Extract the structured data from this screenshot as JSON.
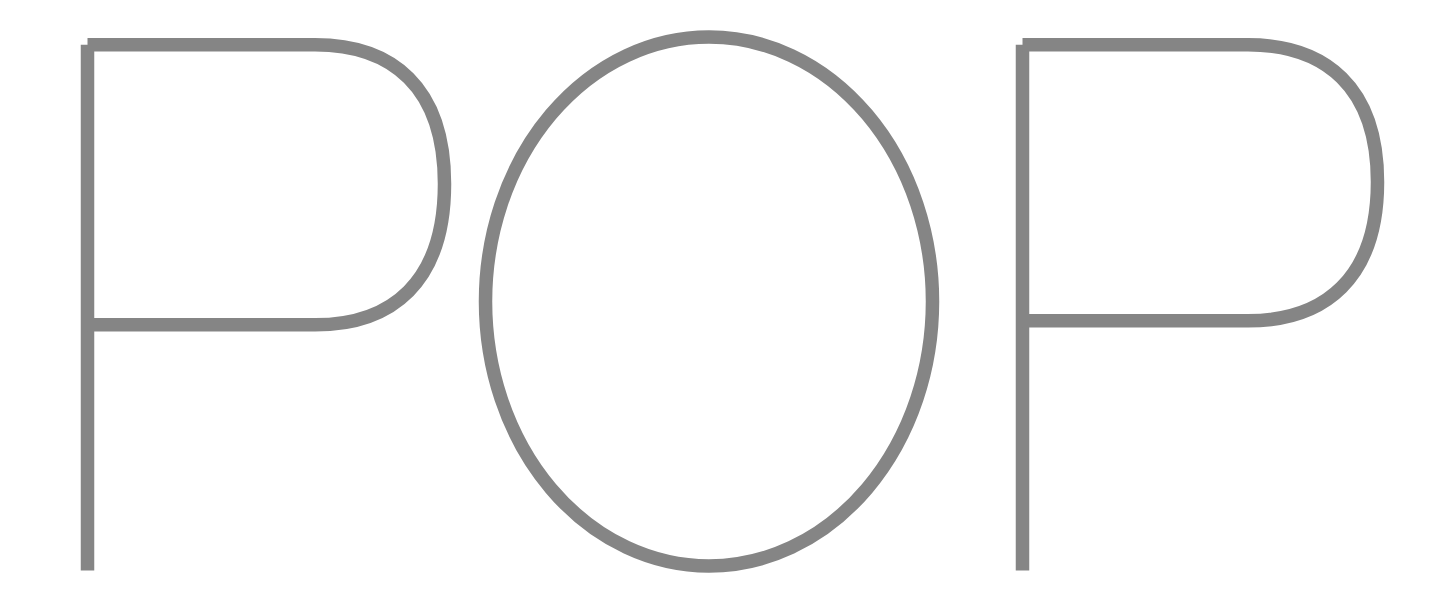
{
  "artwork": {
    "title": "POP",
    "letters": [
      {
        "id": "letter-p-left",
        "character": "P"
      },
      {
        "id": "letter-o-middle",
        "character": "O"
      },
      {
        "id": "letter-p-right",
        "character": "P"
      }
    ],
    "style": {
      "background_color": "#ffffff",
      "stroke_color": "#858585",
      "stroke_width_px": "13.5",
      "fill": "none"
    },
    "canvas": {
      "width_px": "1444",
      "height_px": "607"
    }
  }
}
